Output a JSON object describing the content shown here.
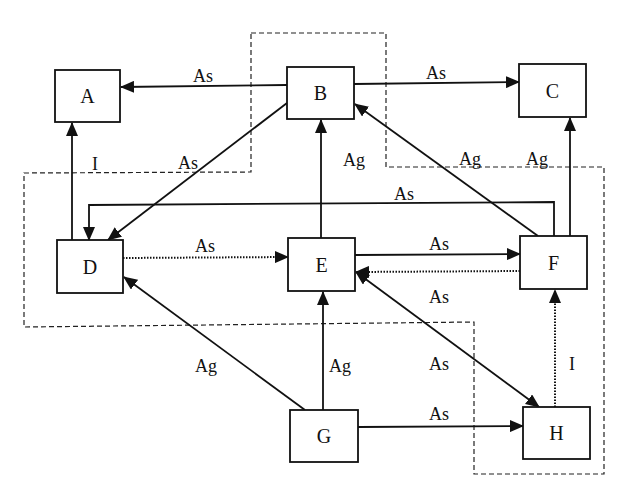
{
  "diagram": {
    "nodes": [
      {
        "id": "A",
        "label": "A",
        "x": 55,
        "y": 70,
        "w": 65,
        "h": 52
      },
      {
        "id": "B",
        "label": "B",
        "x": 287,
        "y": 67,
        "w": 67,
        "h": 52
      },
      {
        "id": "C",
        "label": "C",
        "x": 519,
        "y": 64,
        "w": 67,
        "h": 53
      },
      {
        "id": "D",
        "label": "D",
        "x": 57,
        "y": 240,
        "w": 66,
        "h": 53
      },
      {
        "id": "E",
        "label": "E",
        "x": 288,
        "y": 238,
        "w": 67,
        "h": 53
      },
      {
        "id": "F",
        "label": "F",
        "x": 520,
        "y": 236,
        "w": 67,
        "h": 53
      },
      {
        "id": "G",
        "label": "G",
        "x": 290,
        "y": 410,
        "w": 68,
        "h": 52
      },
      {
        "id": "H",
        "label": "H",
        "x": 523,
        "y": 407,
        "w": 67,
        "h": 52
      }
    ],
    "edges": [
      {
        "from": "B",
        "to": "A",
        "label": "As",
        "style": "solid"
      },
      {
        "from": "B",
        "to": "C",
        "label": "As",
        "style": "solid"
      },
      {
        "from": "D",
        "to": "A",
        "label": "I",
        "style": "solid"
      },
      {
        "from": "B",
        "to": "D",
        "label": "As",
        "style": "solid"
      },
      {
        "from": "E",
        "to": "B",
        "label": "Ag",
        "style": "solid"
      },
      {
        "from": "F",
        "to": "B",
        "label": "Ag",
        "style": "solid"
      },
      {
        "from": "F",
        "to": "C",
        "label": "Ag",
        "style": "solid"
      },
      {
        "from": "F",
        "to": "D",
        "label": "As",
        "style": "solid"
      },
      {
        "from": "D",
        "to": "E",
        "label": "As",
        "style": "dotted"
      },
      {
        "from": "E",
        "to": "F",
        "label": "As",
        "style": "solid"
      },
      {
        "from": "F",
        "to": "E",
        "label": "As",
        "style": "dotted"
      },
      {
        "from": "E",
        "to": "H",
        "label": "As",
        "style": "solid",
        "bidirectional": true
      },
      {
        "from": "G",
        "to": "D",
        "label": "Ag",
        "style": "solid"
      },
      {
        "from": "G",
        "to": "E",
        "label": "Ag",
        "style": "solid"
      },
      {
        "from": "G",
        "to": "H",
        "label": "As",
        "style": "solid"
      },
      {
        "from": "H",
        "to": "F",
        "label": "I",
        "style": "dotted"
      }
    ],
    "labels": {
      "BA": "As",
      "BC": "As",
      "DA": "I",
      "BD": "As",
      "EB": "Ag",
      "FB": "Ag",
      "FC": "Ag",
      "FD": "As",
      "DE": "As",
      "EF": "As",
      "FE": "As",
      "EH": "As",
      "GD": "Ag",
      "GE": "Ag",
      "GH": "As",
      "HF": "I"
    },
    "regions": [
      {
        "name": "dashed-boundary",
        "style": "dashed"
      }
    ]
  }
}
